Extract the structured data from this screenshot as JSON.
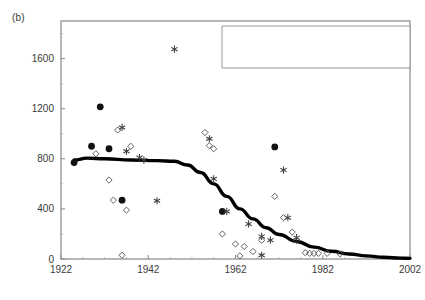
{
  "panel_label": "(b)",
  "legend": {
    "items": [
      {
        "marker": "filled-circle",
        "label": "hunted"
      },
      {
        "marker": "asterisk",
        "label": "all other known recovery reasons"
      },
      {
        "marker": "open-diamond",
        "label": "unknown recovery circumstances"
      }
    ]
  },
  "chart_data": {
    "type": "scatter",
    "title": "",
    "xlabel": "Year",
    "ylabel": "Distance (km)",
    "xlim": [
      1922,
      2002
    ],
    "ylim": [
      0,
      1900
    ],
    "xticks": [
      1922,
      1942,
      1962,
      1982,
      2002
    ],
    "yticks": [
      0,
      400,
      800,
      1200,
      1600
    ],
    "ytick_labels": [
      "0",
      "400",
      "800",
      "1200",
      "1600"
    ],
    "xtick_labels": [
      "1922",
      "1942",
      "1962",
      "1982",
      "2002"
    ],
    "grid": false,
    "legend_position": "top-right",
    "series": [
      {
        "name": "hunted",
        "marker": "filled-circle",
        "points": [
          [
            1925,
            770
          ],
          [
            1929,
            900
          ],
          [
            1931,
            1215
          ],
          [
            1933,
            880
          ],
          [
            1936,
            470
          ],
          [
            1959,
            380
          ],
          [
            1971,
            895
          ]
        ]
      },
      {
        "name": "all other known recovery reasons",
        "marker": "asterisk",
        "points": [
          [
            1948,
            1675
          ],
          [
            1936,
            1050
          ],
          [
            1937,
            860
          ],
          [
            1940,
            810
          ],
          [
            1941,
            790
          ],
          [
            1944,
            465
          ],
          [
            1956,
            960
          ],
          [
            1957,
            640
          ],
          [
            1960,
            380
          ],
          [
            1965,
            280
          ],
          [
            1968,
            180
          ],
          [
            1968,
            30
          ],
          [
            1973,
            710
          ],
          [
            1974,
            330
          ],
          [
            1976,
            170
          ],
          [
            1970,
            150
          ]
        ]
      },
      {
        "name": "unknown recovery circumstances",
        "marker": "open-diamond",
        "points": [
          [
            1930,
            840
          ],
          [
            1933,
            630
          ],
          [
            1935,
            1030
          ],
          [
            1938,
            900
          ],
          [
            1955,
            1010
          ],
          [
            1956,
            905
          ],
          [
            1957,
            880
          ],
          [
            1934,
            470
          ],
          [
            1937,
            390
          ],
          [
            1959,
            200
          ],
          [
            1962,
            120
          ],
          [
            1964,
            100
          ],
          [
            1966,
            60
          ],
          [
            1968,
            150
          ],
          [
            1971,
            500
          ],
          [
            1973,
            330
          ],
          [
            1975,
            215
          ],
          [
            1976,
            150
          ],
          [
            1978,
            50
          ],
          [
            1979,
            45
          ],
          [
            1980,
            45
          ],
          [
            1981,
            45
          ],
          [
            1983,
            45
          ],
          [
            1986,
            40
          ],
          [
            1936,
            30
          ],
          [
            1963,
            25
          ]
        ]
      }
    ],
    "trend_line": {
      "name": "fitted trend",
      "points": [
        [
          1925,
          790
        ],
        [
          1928,
          805
        ],
        [
          1932,
          800
        ],
        [
          1938,
          790
        ],
        [
          1944,
          785
        ],
        [
          1948,
          780
        ],
        [
          1951,
          750
        ],
        [
          1954,
          690
        ],
        [
          1957,
          600
        ],
        [
          1960,
          500
        ],
        [
          1963,
          400
        ],
        [
          1966,
          320
        ],
        [
          1969,
          250
        ],
        [
          1972,
          195
        ],
        [
          1976,
          140
        ],
        [
          1980,
          95
        ],
        [
          1984,
          62
        ],
        [
          1988,
          40
        ],
        [
          1992,
          25
        ],
        [
          1996,
          14
        ],
        [
          2000,
          7
        ],
        [
          2002,
          5
        ]
      ]
    }
  }
}
